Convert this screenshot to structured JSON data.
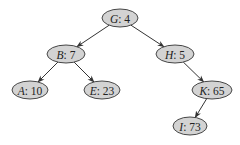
{
  "diagram": {
    "type": "binary-tree",
    "nodes": [
      {
        "id": "G",
        "key": "G",
        "value": "4",
        "label": "G: 4",
        "cx": 120,
        "cy": 18,
        "rx": 18,
        "ry": 9
      },
      {
        "id": "B",
        "key": "B",
        "value": "7",
        "label": "B: 7",
        "cx": 66,
        "cy": 54,
        "rx": 19,
        "ry": 9
      },
      {
        "id": "H",
        "key": "H",
        "value": "5",
        "label": "H: 5",
        "cx": 175,
        "cy": 54,
        "rx": 19,
        "ry": 9
      },
      {
        "id": "A",
        "key": "A",
        "value": "10",
        "label": "A: 10",
        "cx": 30,
        "cy": 90,
        "rx": 18,
        "ry": 9
      },
      {
        "id": "E",
        "key": "E",
        "value": "23",
        "label": "E: 23",
        "cx": 102,
        "cy": 90,
        "rx": 18,
        "ry": 9
      },
      {
        "id": "K",
        "key": "K",
        "value": "65",
        "label": "K: 65",
        "cx": 212,
        "cy": 90,
        "rx": 20,
        "ry": 9
      },
      {
        "id": "I",
        "key": "I",
        "value": "73",
        "label": "I: 73",
        "cx": 190,
        "cy": 126,
        "rx": 17,
        "ry": 9
      }
    ],
    "edges": [
      {
        "from": "G",
        "to": "B"
      },
      {
        "from": "G",
        "to": "H"
      },
      {
        "from": "B",
        "to": "A"
      },
      {
        "from": "B",
        "to": "E"
      },
      {
        "from": "H",
        "to": "K"
      },
      {
        "from": "K",
        "to": "I"
      }
    ],
    "colors": {
      "node_fill": "#d3d3d3",
      "node_stroke": "#333333",
      "edge": "#333333",
      "text": "#222222",
      "background": "#ffffff"
    }
  }
}
